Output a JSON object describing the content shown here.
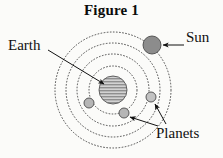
{
  "figure": {
    "title": "Figure 1",
    "type": "geocentric-orbit-diagram",
    "background_color": "#fbfbf9",
    "line_color": "#3a3a3a"
  },
  "labels": {
    "earth": "Earth",
    "sun": "Sun",
    "planets": "Planets"
  },
  "bodies": {
    "earth": {
      "name": "Earth",
      "cx": 113,
      "cy": 90,
      "r": 14,
      "fill": "#b8b8b8",
      "pattern": "horizontal-stripes"
    },
    "sun": {
      "name": "Sun",
      "cx": 152,
      "cy": 45,
      "r": 9,
      "fill": "#8c8c8c"
    },
    "planets": [
      {
        "name": "planet-left",
        "cx": 89,
        "cy": 103,
        "r": 5,
        "fill": "#b5b5b5"
      },
      {
        "name": "planet-bottom",
        "cx": 124,
        "cy": 113,
        "r": 5,
        "fill": "#b5b5b5"
      },
      {
        "name": "planet-right",
        "cx": 151,
        "cy": 97,
        "r": 5,
        "fill": "#c2c2c2"
      }
    ]
  },
  "orbits": [
    {
      "name": "orbit-1",
      "cx": 113,
      "cy": 90,
      "r": 24
    },
    {
      "name": "orbit-2",
      "cx": 113,
      "cy": 90,
      "r": 36
    },
    {
      "name": "orbit-3",
      "cx": 113,
      "cy": 90,
      "r": 47
    },
    {
      "name": "orbit-4",
      "cx": 113,
      "cy": 90,
      "r": 58
    }
  ],
  "leaders": [
    {
      "name": "earth-leader",
      "x1": 48,
      "y1": 50,
      "x2": 104,
      "y2": 84
    },
    {
      "name": "sun-leader",
      "x1": 184,
      "y1": 45,
      "x2": 163,
      "y2": 45
    },
    {
      "name": "planets-leader-right",
      "x1": 166,
      "y1": 124,
      "x2": 155,
      "y2": 104
    },
    {
      "name": "planets-leader-bottom",
      "x1": 158,
      "y1": 126,
      "x2": 130,
      "y2": 117
    }
  ]
}
